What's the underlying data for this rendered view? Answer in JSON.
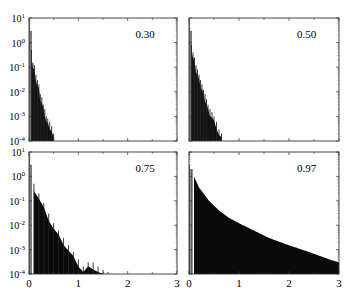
{
  "chart_data": [
    {
      "type": "bar",
      "panel": "top-left",
      "annotation": "0.30",
      "xlim": [
        0,
        3
      ],
      "ylim": [
        0.0001,
        10
      ],
      "yscale": "log",
      "xticks": [
        0,
        1,
        2,
        3
      ],
      "yticks": [
        "10^-4",
        "10^-3",
        "10^-2",
        "10^-1",
        "10^0",
        "10^1"
      ],
      "x": [
        0.02,
        0.05,
        0.08,
        0.11,
        0.14,
        0.17,
        0.2,
        0.23,
        0.26,
        0.29,
        0.32,
        0.35,
        0.38,
        0.42,
        0.46,
        0.5
      ],
      "values": [
        5,
        0.5,
        0.15,
        0.12,
        0.05,
        0.03,
        0.02,
        0.008,
        0.006,
        0.003,
        0.002,
        0.001,
        0.0008,
        0.0006,
        0.0004,
        0.0002
      ]
    },
    {
      "type": "bar",
      "panel": "top-right",
      "annotation": "0.50",
      "xlim": [
        0,
        3
      ],
      "ylim": [
        0.0001,
        10
      ],
      "yscale": "log",
      "xticks": [
        0,
        1,
        2,
        3
      ],
      "x": [
        0.02,
        0.05,
        0.08,
        0.11,
        0.14,
        0.17,
        0.2,
        0.23,
        0.26,
        0.29,
        0.32,
        0.35,
        0.38,
        0.42,
        0.46,
        0.5,
        0.55,
        0.6,
        0.65
      ],
      "values": [
        5,
        0.8,
        0.4,
        0.25,
        0.12,
        0.08,
        0.05,
        0.03,
        0.02,
        0.012,
        0.008,
        0.005,
        0.003,
        0.002,
        0.0015,
        0.001,
        0.0006,
        0.0003,
        0.0002
      ]
    },
    {
      "type": "bar",
      "panel": "bottom-left",
      "annotation": "0.75",
      "xlim": [
        0,
        3
      ],
      "ylim": [
        0.0001,
        10
      ],
      "yscale": "log",
      "xticks": [
        0,
        1,
        2,
        3
      ],
      "yticks": [
        "10^-4",
        "10^-3",
        "10^-2",
        "10^-1",
        "10^0",
        "10^1"
      ],
      "x": [
        0.02,
        0.1,
        0.2,
        0.3,
        0.4,
        0.5,
        0.6,
        0.7,
        0.8,
        0.9,
        1.0,
        1.1,
        1.2,
        1.3,
        1.4,
        1.5,
        1.6
      ],
      "values": [
        5,
        0.5,
        0.2,
        0.08,
        0.03,
        0.012,
        0.006,
        0.003,
        0.0015,
        0.0008,
        0.0004,
        0.0002,
        0.0003,
        0.0003,
        0.0002,
        0.00015,
        0.00012
      ]
    },
    {
      "type": "area",
      "panel": "bottom-right",
      "annotation": "0.97",
      "xlim": [
        0,
        3
      ],
      "ylim": [
        0.0001,
        10
      ],
      "yscale": "log",
      "xticks": [
        0,
        1,
        2,
        3
      ],
      "x": [
        0.02,
        0.1,
        0.2,
        0.4,
        0.6,
        0.8,
        1.0,
        1.3,
        1.6,
        2.0,
        2.4,
        2.8,
        3.0
      ],
      "values": [
        5,
        1.0,
        0.35,
        0.1,
        0.04,
        0.02,
        0.012,
        0.006,
        0.003,
        0.0015,
        0.0008,
        0.0004,
        0.0003
      ]
    }
  ],
  "axes": {
    "y_tick_labels": [
      {
        "base": "10",
        "exp": "1"
      },
      {
        "base": "10",
        "exp": "0"
      },
      {
        "base": "10",
        "exp": "-1"
      },
      {
        "base": "10",
        "exp": "-2"
      },
      {
        "base": "10",
        "exp": "-3"
      },
      {
        "base": "10",
        "exp": "-4"
      }
    ],
    "x_tick_labels": [
      "0",
      "1",
      "2",
      "3"
    ]
  },
  "panels": {
    "tl": {
      "label": "0.30"
    },
    "tr": {
      "label": "0.50"
    },
    "bl": {
      "label": "0.75"
    },
    "br": {
      "label": "0.97"
    }
  }
}
